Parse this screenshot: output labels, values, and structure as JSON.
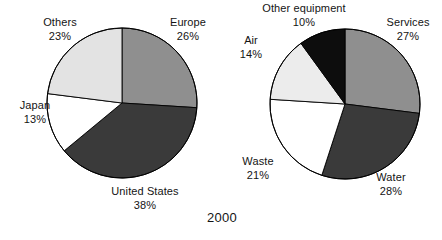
{
  "figure": {
    "caption": "2000",
    "background_color": "#ffffff",
    "outline_color": "#000000"
  },
  "chart_data": [
    {
      "type": "pie",
      "title": "",
      "chart_index": 0,
      "position": "left",
      "center": [
        122,
        103
      ],
      "radius": 75,
      "start_angle_deg": 0,
      "direction": "clockwise",
      "labels": [
        "Europe",
        "United States",
        "Japan",
        "Others"
      ],
      "values": [
        26,
        38,
        13,
        23
      ],
      "value_suffix": "%",
      "value_labels": [
        "26%",
        "38%",
        "13%",
        "23%"
      ],
      "colors": [
        "#8f8f8f",
        "#3a3a3a",
        "#ffffff",
        "#e3e3e3"
      ],
      "legend": "none",
      "slices": [
        {
          "label": "Europe",
          "value": 26,
          "value_label": "26%",
          "color": "#8f8f8f"
        },
        {
          "label": "United States",
          "value": 38,
          "value_label": "38%",
          "color": "#3a3a3a"
        },
        {
          "label": "Japan",
          "value": 13,
          "value_label": "13%",
          "color": "#ffffff"
        },
        {
          "label": "Others",
          "value": 23,
          "value_label": "23%",
          "color": "#e3e3e3"
        }
      ]
    },
    {
      "type": "pie",
      "title": "",
      "chart_index": 1,
      "position": "right",
      "center": [
        345,
        104
      ],
      "radius": 75,
      "start_angle_deg": 0,
      "direction": "clockwise",
      "labels": [
        "Services",
        "Water",
        "Waste",
        "Air",
        "Other equipment"
      ],
      "values": [
        27,
        28,
        21,
        14,
        10
      ],
      "value_suffix": "%",
      "value_labels": [
        "27%",
        "28%",
        "21%",
        "14%",
        "10%"
      ],
      "colors": [
        "#8f8f8f",
        "#3a3a3a",
        "#ffffff",
        "#ececec",
        "#0d0d0d"
      ],
      "legend": "none",
      "slices": [
        {
          "label": "Services",
          "value": 27,
          "value_label": "27%",
          "color": "#8f8f8f"
        },
        {
          "label": "Water",
          "value": 28,
          "value_label": "28%",
          "color": "#3a3a3a"
        },
        {
          "label": "Waste",
          "value": 21,
          "value_label": "21%",
          "color": "#ffffff"
        },
        {
          "label": "Air",
          "value": 14,
          "value_label": "14%",
          "color": "#ececec"
        },
        {
          "label": "Other equipment",
          "value": 10,
          "value_label": "10%",
          "color": "#0d0d0d"
        }
      ]
    }
  ],
  "labels": {
    "left": {
      "others": {
        "name": "Others",
        "value": "23%"
      },
      "europe": {
        "name": "Europe",
        "value": "26%"
      },
      "japan": {
        "name": "Japan",
        "value": "13%"
      },
      "united_states": {
        "name": "United States",
        "value": "38%"
      }
    },
    "right": {
      "other_equipment": {
        "name": "Other equipment",
        "value": "10%"
      },
      "services": {
        "name": "Services",
        "value": "27%"
      },
      "air": {
        "name": "Air",
        "value": "14%"
      },
      "waste": {
        "name": "Waste",
        "value": "21%"
      },
      "water": {
        "name": "Water",
        "value": "28%"
      }
    }
  }
}
